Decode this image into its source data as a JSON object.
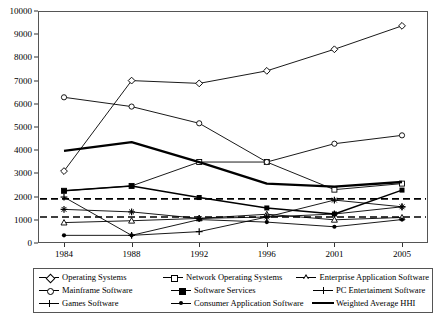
{
  "chart_data": {
    "type": "line",
    "title": "",
    "xlabel": "",
    "ylabel": "",
    "categories": [
      "1984",
      "1988",
      "1992",
      "1996",
      "2001",
      "2005"
    ],
    "ylim": [
      0,
      10000
    ],
    "ytick_labels": [
      "0",
      "1000",
      "2000",
      "3000",
      "4000",
      "5000",
      "6000",
      "7000",
      "8000",
      "9000",
      "10000"
    ],
    "ytick_values": [
      0,
      1000,
      2000,
      3000,
      4000,
      5000,
      6000,
      7000,
      8000,
      9000,
      10000
    ],
    "grid": false,
    "legend_position": "below",
    "series": [
      {
        "name": "Operating Systems",
        "marker": "diamond-open",
        "line": "thin",
        "values": [
          3100,
          7000,
          6880,
          7420,
          8350,
          9360
        ]
      },
      {
        "name": "Network Operating Systems",
        "marker": "square-open",
        "line": "thin",
        "values": [
          2250,
          2460,
          3490,
          3490,
          2300,
          2560
        ]
      },
      {
        "name": "Enterprise Application Software",
        "marker": "triangle-open",
        "line": "thin",
        "values": [
          880,
          960,
          1060,
          1240,
          1000,
          1100
        ]
      },
      {
        "name": "Mainframe Software",
        "marker": "circle-open",
        "line": "thin",
        "values": [
          6280,
          5880,
          5160,
          3490,
          4280,
          4640
        ]
      },
      {
        "name": "Software Services",
        "marker": "square-filled",
        "line": "medium",
        "values": [
          2250,
          2460,
          1960,
          1510,
          1250,
          2280
        ]
      },
      {
        "name": "PC Entertaiment Software",
        "marker": "star",
        "line": "thin",
        "values": [
          1450,
          1340,
          1060,
          1120,
          1850,
          1560
        ]
      },
      {
        "name": "Games Software",
        "marker": "plus",
        "line": "thin",
        "values": [
          1980,
          330,
          490,
          1120,
          1250,
          1560
        ]
      },
      {
        "name": "Consumer Application Software",
        "marker": "dot",
        "line": "thin",
        "values": [
          330,
          330,
          1010,
          900,
          700,
          1010
        ]
      },
      {
        "name": "Weighted Average HHI",
        "marker": "none",
        "line": "thick",
        "values": [
          3970,
          4350,
          3490,
          2560,
          2430,
          2630
        ]
      }
    ],
    "reference_lines": [
      {
        "value": 1900,
        "style": "dashed"
      },
      {
        "value": 1120,
        "style": "dashed"
      }
    ]
  },
  "legend": {
    "rows": [
      [
        {
          "label": "Operating Systems",
          "marker": "diamond-open",
          "line": "thin"
        },
        {
          "label": "Network Operating Systems",
          "marker": "square-open",
          "line": "thin"
        },
        {
          "label": "Enterprise Application Software",
          "marker": "triangle-open",
          "line": "thin"
        }
      ],
      [
        {
          "label": "Mainframe Software",
          "marker": "circle-open",
          "line": "thin"
        },
        {
          "label": "Software Services",
          "marker": "square-filled",
          "line": "thin"
        },
        {
          "label": "PC Entertaiment Software",
          "marker": "star",
          "line": "thin"
        }
      ],
      [
        {
          "label": "Games Software",
          "marker": "plus",
          "line": "thin"
        },
        {
          "label": "Consumer Application Software",
          "marker": "dot",
          "line": "thin"
        },
        {
          "label": "Weighted Average HHI",
          "marker": "none",
          "line": "thick"
        }
      ]
    ]
  },
  "colors": {
    "line": "#000000",
    "frame": "#555555",
    "background": "#ffffff"
  }
}
